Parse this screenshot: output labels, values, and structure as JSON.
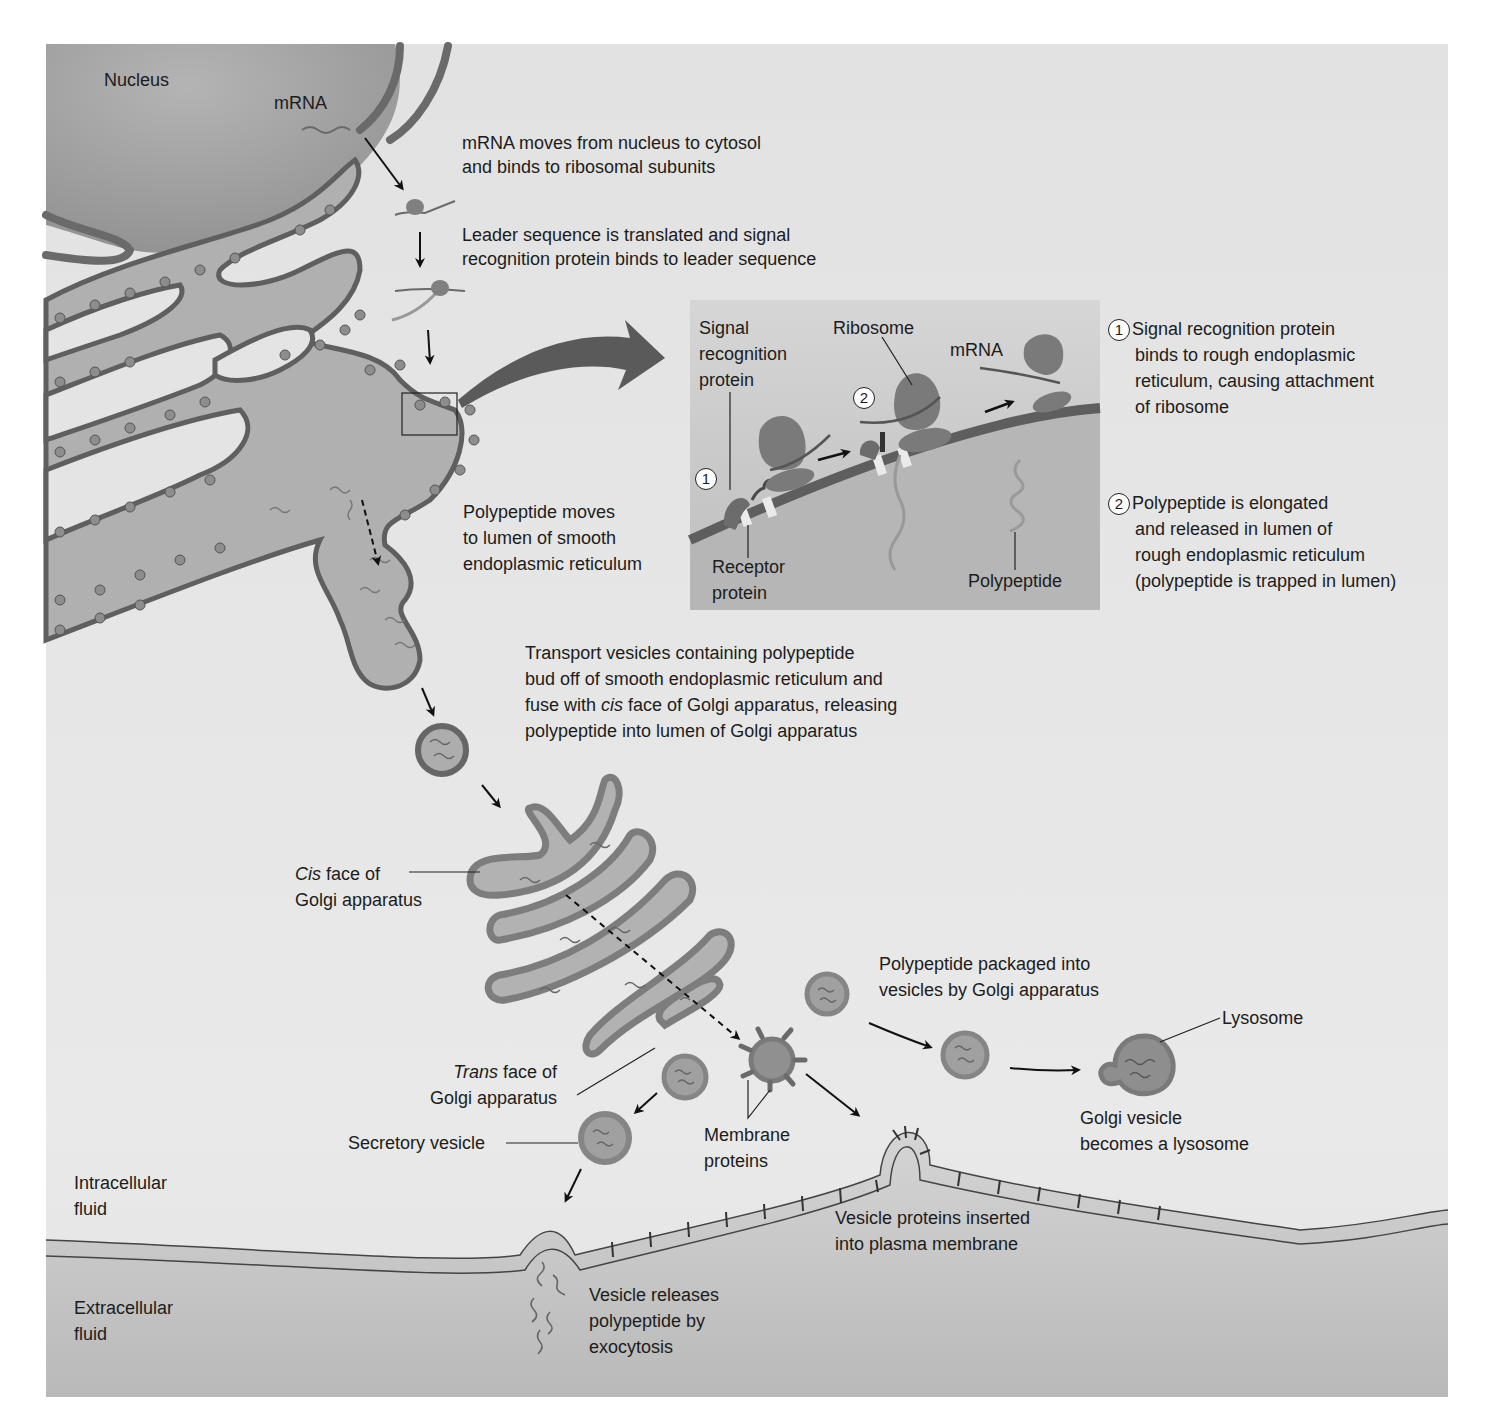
{
  "colors": {
    "frame_bg": "#e6e6e6",
    "nucleus": "#a9a9a9",
    "er_fill": "#b3b3b3",
    "membrane": "#6e6e6e",
    "ribosome": "#7f7f7f",
    "inset_bg": "#c9c9c9",
    "extracellular": "#c2c2c2",
    "text": "#1c1c1c"
  },
  "regions": {
    "nucleus": "Nucleus",
    "intracellular": [
      "Intracellular",
      "fluid"
    ],
    "extracellular": [
      "Extracellular",
      "fluid"
    ]
  },
  "labels": {
    "mrna_top": "mRNA",
    "step_mrna": [
      "mRNA moves from nucleus to cytosol",
      "and binds to ribosomal subunits"
    ],
    "step_leader": [
      "Leader sequence is translated and signal",
      "recognition protein binds to leader sequence"
    ],
    "step_smooth_er": [
      "Polypeptide moves",
      "to lumen of smooth",
      "endoplasmic reticulum"
    ],
    "step_transport": [
      "Transport vesicles containing polypeptide",
      "bud off of smooth endoplasmic reticulum and",
      "fuse with ",
      "cis",
      " face of Golgi apparatus, releasing",
      "polypeptide into lumen of Golgi apparatus"
    ],
    "cis_face": [
      "Cis",
      " face of",
      "Golgi apparatus"
    ],
    "trans_face": [
      "Trans",
      " face of",
      "Golgi apparatus"
    ],
    "secretory_vesicle": "Secretory vesicle",
    "membrane_proteins": [
      "Membrane",
      "proteins"
    ],
    "packaged": [
      "Polypeptide packaged into",
      "vesicles by Golgi apparatus"
    ],
    "lysosome": "Lysosome",
    "golgi_lysosome": [
      "Golgi vesicle",
      "becomes a lysosome"
    ],
    "inserted": [
      "Vesicle proteins inserted",
      "into plasma membrane"
    ],
    "exocytosis": [
      "Vesicle releases",
      "polypeptide by",
      "exocytosis"
    ]
  },
  "inset": {
    "signal_recognition_protein": [
      "Signal",
      "recognition",
      "protein"
    ],
    "ribosome": "Ribosome",
    "mrna": "mRNA",
    "receptor_protein": [
      "Receptor",
      "protein"
    ],
    "polypeptide": "Polypeptide",
    "marker1": "1",
    "marker2": "2"
  },
  "legend": {
    "step1": {
      "num": "1",
      "lines": [
        "Signal recognition protein",
        "binds to rough endoplasmic",
        "reticulum, causing attachment",
        "of ribosome"
      ]
    },
    "step2": {
      "num": "2",
      "lines": [
        "Polypeptide is elongated",
        "and released in lumen of",
        "rough endoplasmic reticulum",
        "(polypeptide is trapped in lumen)"
      ]
    }
  }
}
